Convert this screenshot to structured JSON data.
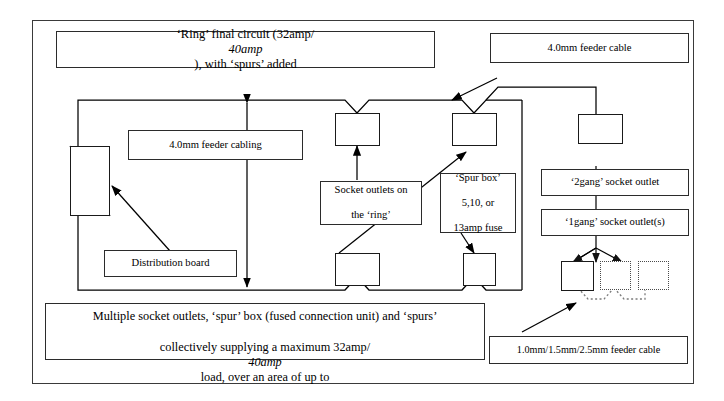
{
  "diagram": {
    "title_box": {
      "text": "‘Ring’ final circuit (32amp/40amp), with ‘spurs’ added",
      "plain_a": "‘Ring’ final circuit (32amp/",
      "italic_a": "40amp",
      "plain_b": "), with ‘spurs’ added"
    },
    "caption_box": {
      "line1": "Multiple socket outlets, ‘spur’ box (fused connection unit) and ‘spurs’",
      "line2_a": "collectively supplying a maximum 32amp/",
      "line2_italic": "40amp",
      "line2_b": " load, over an area of up to",
      "line3": "100m\\2"
    },
    "labels": {
      "feeder_cable_top": "4.0mm feeder cable",
      "feeder_cabling_ring": "4.0mm feeder cabling",
      "socket_outlets_ring_l1": "Socket outlets on",
      "socket_outlets_ring_l2": "the ‘ring’",
      "spur_box_l1": "‘Spur box’",
      "spur_box_l2": "5,10, or",
      "spur_box_l3": "13amp fuse",
      "two_gang": "‘2gang’ socket outlet",
      "one_gang": "‘1gang’ socket outlet(s)",
      "distribution_board": "Distribution board",
      "feeder_cable_spur": "1.0mm/1.5mm/2.5mm feeder cable"
    },
    "colors": {
      "frame": "#3a3a3a",
      "box_border": "#2b2b2b",
      "node_border": "#1a1a1a",
      "wire": "#000000",
      "dotted_wire": "#6e6e6e",
      "background": "#ffffff"
    }
  }
}
